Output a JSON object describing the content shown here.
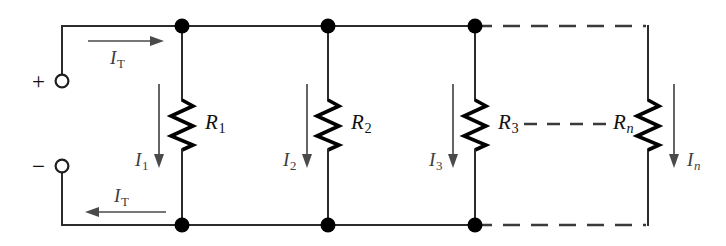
{
  "figure": {
    "name": "parallel-resistor-circuit",
    "colors": {
      "wire": "#2b2b2b",
      "resistor": "#000000",
      "arrow": "#4a4a4a",
      "node": "#000000",
      "background": "#ffffff"
    }
  },
  "terminals": {
    "positive": {
      "sign": "+",
      "polarity_name": "positive-terminal"
    },
    "negative": {
      "sign": "−",
      "polarity_name": "negative-terminal"
    }
  },
  "currents": {
    "total_top": {
      "symbol": "I",
      "subscript": "T",
      "direction": "right"
    },
    "total_bottom": {
      "symbol": "I",
      "subscript": "T",
      "direction": "left"
    },
    "branches": [
      {
        "symbol": "I",
        "subscript": "1",
        "direction": "down"
      },
      {
        "symbol": "I",
        "subscript": "2",
        "direction": "down"
      },
      {
        "symbol": "I",
        "subscript": "3",
        "direction": "down"
      },
      {
        "symbol": "I",
        "subscript": "n",
        "direction": "down",
        "italic_subscript": true
      }
    ]
  },
  "resistors": [
    {
      "symbol": "R",
      "subscript": "1"
    },
    {
      "symbol": "R",
      "subscript": "2"
    },
    {
      "symbol": "R",
      "subscript": "3"
    },
    {
      "symbol": "R",
      "subscript": "n",
      "italic_subscript": true
    }
  ],
  "continuation": {
    "glyph": "dashed-line",
    "meaning": "additional parallel branches omitted"
  }
}
